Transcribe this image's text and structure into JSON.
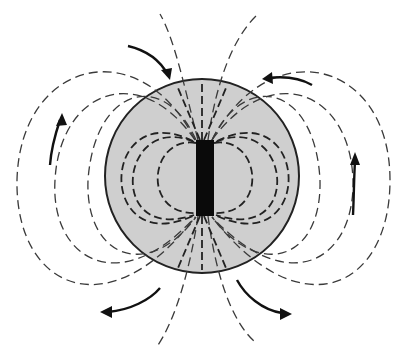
{
  "diagram": {
    "colors": {
      "background": "#ffffff",
      "sphere_fill": "#cfcfcf",
      "sphere_outline": "#222222",
      "magnet": "#0a0a0a",
      "field_lines": "#3a3a3a",
      "arrows": "#111111"
    },
    "sphere": {
      "cx": 202,
      "cy": 176,
      "r": 97
    },
    "magnet": {
      "x": 196,
      "y": 140,
      "width": 18,
      "height": 76
    },
    "arrows": [
      {
        "label": "upper-left arrow",
        "direction": "toward north pole"
      },
      {
        "label": "upper-right arrow",
        "direction": "toward north pole"
      },
      {
        "label": "left-side arrow",
        "direction": "upward"
      },
      {
        "label": "right-side arrow",
        "direction": "upward"
      },
      {
        "label": "lower-left arrow",
        "direction": "away from south pole"
      },
      {
        "label": "lower-right arrow",
        "direction": "away from south pole"
      }
    ]
  }
}
